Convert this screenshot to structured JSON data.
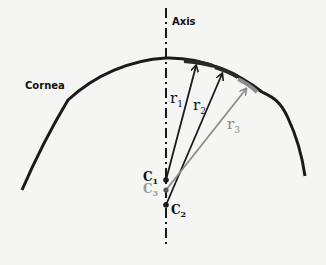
{
  "labels": {
    "axis": "Axis",
    "cornea": "Cornea",
    "r1": "r",
    "r1_sub": "1",
    "r2": "r",
    "r2_sub": "2",
    "r3": "r",
    "r3_sub": "3",
    "c1": "C",
    "c1_sub": "1",
    "c2": "C",
    "c2_sub": "2",
    "c3": "C",
    "c3_sub": "3"
  },
  "colors": {
    "primary": "#1a1a1a",
    "secondary": "#8c8c8c",
    "background": "#f5f5f3"
  }
}
